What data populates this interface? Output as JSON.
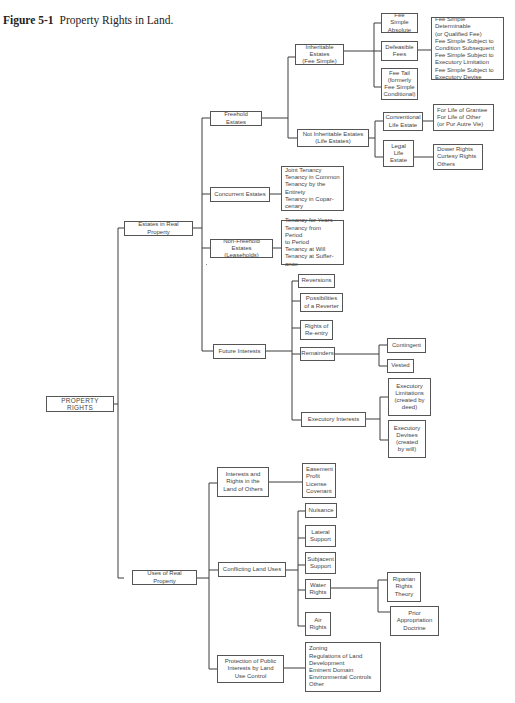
{
  "caption": {
    "label": "Figure 5-1",
    "title": "Property Rights in Land."
  },
  "diagram": {
    "root": "PROPERTY RIGHTS",
    "estates": {
      "label": "Estates in Real Property",
      "freehold": {
        "label": "Freehold Estates",
        "inheritable": {
          "label": "Inheritable Estates\n(Fee Simple)",
          "absolute": "Fee Simple\nAbsolute",
          "defeasible": "Defeasible\nFees",
          "defeasible_types": "Fee Simple Determinable\n   (or Qualified Fee)\nFee Simple Subject to\n   Condition Subsequent\nFee Simple Subject to\n   Executory Limitation\nFee Simple Subject to\n   Executory Devise",
          "fee_tail": "Fee Tail\n(formerly\nFee Simple\nConditional)"
        },
        "not_inheritable": {
          "label": "Not Inheritable Estates\n(Life Estates)",
          "conventional": "Conventional\nLife Estate",
          "conventional_types": "For Life of Grantee\nFor Life of Other\n   (or Pur Autre Vie)",
          "legal": "Legal\nLife\nEstate",
          "legal_types": "Dower Rights\nCurtesy Rights\nOthers"
        }
      },
      "concurrent": {
        "label": "Concurrent Estates",
        "types": "Joint Tenancy\nTenancy in Common\nTenancy by the\n   Entirety\nTenancy in Copar-\n   cenary"
      },
      "non_freehold": {
        "label": "Non-Freehold Estates\n(Leaseholds)",
        "types": "Tenancy for Years\nTenancy from Period\n   to Period\nTenancy at Will\nTenancy at Suffer-\n   ance"
      },
      "future": {
        "label": "Future Interests",
        "reversions": "Reversions",
        "possibilities": "Possibilities\nof a Reverter",
        "reentry": "Rights of\nRe-entry",
        "remainders": "Remainders",
        "contingent": "Contingent",
        "vested": "Vested",
        "executory": "Executory Interests",
        "exec_limitations": "Executory\nLimitations\n(created by\ndeed)",
        "exec_devises": "Executory\nDevises\n(created\nby will)"
      }
    },
    "uses": {
      "label": "Uses of Real Property",
      "others": {
        "label": "Interests and\nRights in the\nLand of Others",
        "types": "Easement\nProfit\nLicense\nCovenant"
      },
      "conflicting": {
        "label": "Conflicting Land Uses",
        "nuisance": "Nuisance",
        "lateral": "Lateral\nSupport",
        "subjacent": "Subjacent\nSupport",
        "water": "Water\nRights",
        "riparian": "Riparian\nRights\nTheory",
        "prior": "Prior\nAppropriation\nDoctrine",
        "air": "Air\nRights"
      },
      "public": {
        "label": "Protection of Public\nInterests by Land\nUse Control",
        "types": "Zoning\nRegulations of Land\n   Development\nEminent Domain\nEnvironmental Controls\nOther"
      }
    }
  }
}
